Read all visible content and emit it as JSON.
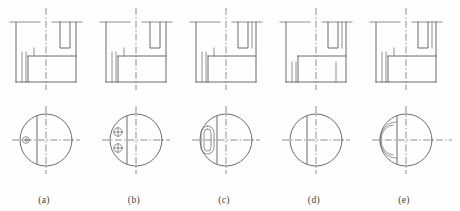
{
  "figure": {
    "kind": "engineering-drawing",
    "background_color": "#fefefe",
    "line_color": "#5b5b5b",
    "center_line_color": "#6b6b6b",
    "label_color": "#3d3d3d"
  },
  "variants": [
    {
      "id": "a",
      "label": "(a)",
      "label_x": 44,
      "label_y": 203,
      "front_view": {
        "origin_x": 14,
        "origin_y": 14,
        "width": 62,
        "height": 68,
        "features": [
          "outer-outline",
          "top-slot-right",
          "hidden-left-rib",
          "inner-step",
          "center-line-vertical"
        ]
      },
      "circle_view": {
        "cx": 46,
        "cy": 140,
        "r": 26,
        "chord_x": 37,
        "features": [
          "circle",
          "vertical-chord",
          "small-hole-left",
          "center-cross"
        ],
        "holes": [
          {
            "cx": 26,
            "cy": 140,
            "r": 3.4,
            "inner_r": 1.3
          }
        ]
      }
    },
    {
      "id": "b",
      "label": "(b)",
      "label_x": 134,
      "label_y": 203,
      "front_view": {
        "origin_x": 104,
        "origin_y": 14,
        "width": 62,
        "height": 68,
        "features": [
          "outer-outline",
          "top-slot-right",
          "hidden-left-rib",
          "inner-step",
          "center-line-vertical"
        ]
      },
      "circle_view": {
        "cx": 136,
        "cy": 140,
        "r": 26,
        "chord_x": 127,
        "features": [
          "circle",
          "vertical-chord",
          "two-small-holes-left",
          "center-cross"
        ],
        "holes": [
          {
            "cx": 118,
            "cy": 132,
            "r": 4.2,
            "inner_r": 1.5
          },
          {
            "cx": 118,
            "cy": 148,
            "r": 4.2,
            "inner_r": 1.5
          }
        ]
      }
    },
    {
      "id": "c",
      "label": "(c)",
      "label_x": 224,
      "label_y": 203,
      "front_view": {
        "origin_x": 192,
        "origin_y": 14,
        "width": 64,
        "height": 68,
        "features": [
          "outer-outline",
          "top-slot-right",
          "hidden-left-rib",
          "inner-step",
          "center-line-vertical"
        ]
      },
      "circle_view": {
        "cx": 226,
        "cy": 140,
        "r": 26,
        "chord_x": 217,
        "features": [
          "circle",
          "vertical-chord",
          "vertical-slot-left",
          "center-cross"
        ],
        "slot": {
          "x": 201,
          "y": 127,
          "w": 12,
          "h": 27,
          "rx": 6
        }
      }
    },
    {
      "id": "d",
      "label": "(d)",
      "label_x": 314,
      "label_y": 203,
      "front_view": {
        "origin_x": 282,
        "origin_y": 14,
        "width": 64,
        "height": 68,
        "features": [
          "outer-outline",
          "top-slot-right",
          "inner-step",
          "two-hidden-ribs",
          "center-line-vertical"
        ]
      },
      "circle_view": {
        "cx": 316,
        "cy": 140,
        "r": 26,
        "chord_x": 307,
        "features": [
          "circle",
          "vertical-chord",
          "center-cross"
        ],
        "holes": []
      }
    },
    {
      "id": "e",
      "label": "(e)",
      "label_x": 404,
      "label_y": 203,
      "front_view": {
        "origin_x": 372,
        "origin_y": 14,
        "width": 64,
        "height": 68,
        "features": [
          "outer-outline",
          "top-slot-right",
          "hidden-left-rib",
          "inner-step",
          "center-line-vertical"
        ]
      },
      "circle_view": {
        "cx": 406,
        "cy": 140,
        "r": 26,
        "chord_x": 397,
        "features": [
          "circle",
          "vertical-chord",
          "arc-pocket-left",
          "center-cross"
        ],
        "arc": {
          "x": 388,
          "y": 124,
          "w": 14,
          "h": 32
        }
      }
    }
  ]
}
